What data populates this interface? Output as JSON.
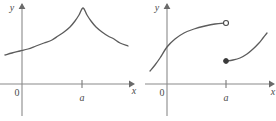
{
  "figure": {
    "title": "",
    "panels": [
      {
        "id": "left-panel",
        "name": "cusp-graph",
        "axes": {
          "x_label": "x",
          "y_label": "y",
          "origin_label": "0"
        },
        "ticks": [
          {
            "axis": "x",
            "label": "a",
            "px": 82
          }
        ]
      },
      {
        "id": "right-panel",
        "name": "jump-discontinuity-graph",
        "axes": {
          "x_label": "x",
          "y_label": "y",
          "origin_label": "0"
        },
        "ticks": [
          {
            "axis": "x",
            "label": "a",
            "px": 226
          }
        ]
      }
    ]
  },
  "chart_data": [
    {
      "type": "line",
      "id": "left-panel",
      "title": "",
      "xlabel": "x",
      "ylabel": "y",
      "grid": false,
      "legend": null,
      "annotations": [
        {
          "text": "0",
          "role": "origin"
        },
        {
          "text": "a",
          "role": "x-tick",
          "x": "a"
        },
        {
          "text": "x",
          "role": "x-axis-name"
        },
        {
          "text": "y",
          "role": "y-axis-name"
        }
      ],
      "description": "Continuous curve with a sharp corner (cusp) peak at x = a; increases to the peak then decreases.",
      "series": [
        {
          "name": "f(x)",
          "points_px": [
            [
              5,
              55
            ],
            [
              12,
              53
            ],
            [
              20,
              51
            ],
            [
              28,
              49
            ],
            [
              36,
              46
            ],
            [
              44,
              43
            ],
            [
              52,
              40
            ],
            [
              58,
              36
            ],
            [
              64,
              32
            ],
            [
              70,
              27
            ],
            [
              75,
              21
            ],
            [
              79,
              15
            ],
            [
              83,
              8
            ],
            [
              87,
              15
            ],
            [
              91,
              21
            ],
            [
              96,
              27
            ],
            [
              102,
              32
            ],
            [
              108,
              36
            ],
            [
              114,
              39
            ],
            [
              120,
              43
            ],
            [
              128,
              46
            ]
          ]
        }
      ]
    },
    {
      "type": "line",
      "id": "right-panel",
      "title": "",
      "xlabel": "x",
      "ylabel": "y",
      "grid": false,
      "legend": null,
      "annotations": [
        {
          "text": "0",
          "role": "origin"
        },
        {
          "text": "a",
          "role": "x-tick",
          "x": "a"
        },
        {
          "text": "x",
          "role": "x-axis-name"
        },
        {
          "text": "y",
          "role": "y-axis-name"
        }
      ],
      "description": "Jump discontinuity at x = a: left branch rises to an open circle; right branch begins at a filled dot below and rises.",
      "series": [
        {
          "name": "left-branch",
          "endpoint": "open",
          "points_px": [
            [
              150,
              71
            ],
            [
              155,
              65
            ],
            [
              160,
              58
            ],
            [
              167,
              47
            ],
            [
              175,
              39
            ],
            [
              184,
              33
            ],
            [
              194,
              29
            ],
            [
              205,
              26
            ],
            [
              215,
              24
            ],
            [
              226,
              23
            ]
          ]
        },
        {
          "name": "right-branch",
          "endpoint": "closed",
          "points_px": [
            [
              226,
              61
            ],
            [
              233,
              60
            ],
            [
              240,
              58
            ],
            [
              247,
              54
            ],
            [
              253,
              49
            ],
            [
              259,
              43
            ],
            [
              263,
              38
            ],
            [
              267,
              33
            ]
          ]
        }
      ],
      "markers": [
        {
          "kind": "open-circle",
          "px": [
            226,
            23
          ]
        },
        {
          "kind": "closed-circle",
          "px": [
            226,
            61
          ]
        }
      ]
    }
  ]
}
